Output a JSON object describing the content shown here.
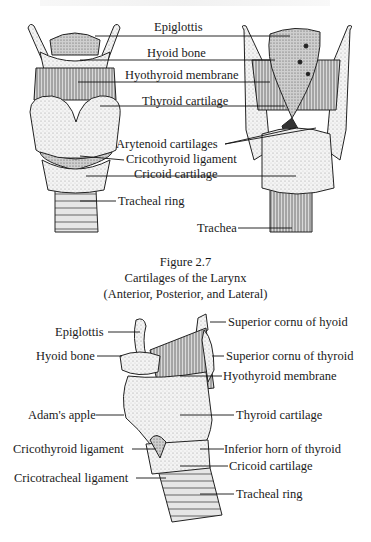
{
  "figure": {
    "number": "Figure 2.7",
    "title": "Cartilages of the Larynx",
    "subtitle": "(Anterior, Posterior, and Lateral)"
  },
  "top_panel": {
    "views": [
      "anterior",
      "posterior"
    ],
    "labels": [
      {
        "id": "epiglottis",
        "text": "Epiglottis"
      },
      {
        "id": "hyoid-bone",
        "text": "Hyoid bone"
      },
      {
        "id": "hyothyroid-membrane",
        "text": "Hyothyroid membrane"
      },
      {
        "id": "thyroid-cartilage",
        "text": "Thyroid cartilage"
      },
      {
        "id": "arytenoid-cartilages",
        "text": "Arytenoid cartilages"
      },
      {
        "id": "cricothyroid-ligament",
        "text": "Cricothyroid ligament"
      },
      {
        "id": "cricoid-cartilage",
        "text": "Cricoid cartilage"
      },
      {
        "id": "tracheal-ring",
        "text": "Tracheal ring"
      },
      {
        "id": "trachea",
        "text": "Trachea"
      }
    ]
  },
  "bottom_panel": {
    "view": "lateral",
    "left_labels": [
      {
        "id": "epiglottis",
        "text": "Epiglottis"
      },
      {
        "id": "hyoid-bone",
        "text": "Hyoid bone"
      },
      {
        "id": "adams-apple",
        "text": "Adam's apple"
      },
      {
        "id": "cricothyroid-ligament",
        "text": "Cricothyroid ligament"
      },
      {
        "id": "cricotracheal-ligament",
        "text": "Cricotracheal ligament"
      }
    ],
    "right_labels": [
      {
        "id": "superior-cornu-hyoid",
        "text": "Superior cornu of hyoid"
      },
      {
        "id": "superior-cornu-thyroid",
        "text": "Superior cornu of thyroid"
      },
      {
        "id": "hyothyroid-membrane",
        "text": "Hyothyroid membrane"
      },
      {
        "id": "thyroid-cartilage",
        "text": "Thyroid cartilage"
      },
      {
        "id": "inferior-horn-thyroid",
        "text": "Inferior horn of thyroid"
      },
      {
        "id": "cricoid-cartilage",
        "text": "Cricoid cartilage"
      },
      {
        "id": "tracheal-ring",
        "text": "Tracheal ring"
      }
    ]
  }
}
